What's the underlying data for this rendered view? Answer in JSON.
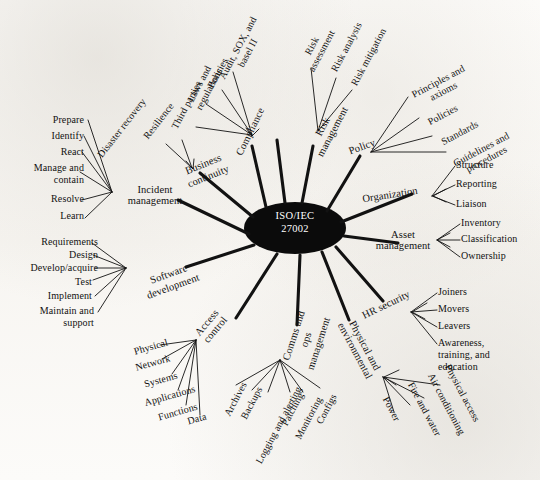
{
  "diagram": {
    "background_color": "#fbfaf8",
    "ink_color": "#111111",
    "center_fill": "#0b0b0b",
    "center_text_color": "#ffffff"
  },
  "center": {
    "label": "ISO/IEC\n27002",
    "line1": "ISO/IEC",
    "line2": "27002"
  },
  "branches": [
    {
      "id": "compliance",
      "label": "Compliance",
      "leaves": [
        "Audit, SOX, and\nbasel II",
        "Policies",
        "Laws and\nregulations",
        "Third parties"
      ]
    },
    {
      "id": "risk-management",
      "label": "Risk\nmanagement",
      "leaves": [
        "Risk\nassessment",
        "Risk analysis",
        "Risk mitigation"
      ]
    },
    {
      "id": "policy",
      "label": "Policy",
      "leaves": [
        "Principles and\naxioms",
        "Policies",
        "Standards",
        "Guidelines and\nprocedures"
      ]
    },
    {
      "id": "organization",
      "label": "Organization",
      "leaves": [
        "Structure",
        "Reporting",
        "Liaison"
      ]
    },
    {
      "id": "asset-management",
      "label": "Asset\nmanagement",
      "leaves": [
        "Inventory",
        "Classification",
        "Ownership"
      ]
    },
    {
      "id": "hr-security",
      "label": "HR security",
      "leaves": [
        "Joiners",
        "Movers",
        "Leavers",
        "Awareness,\ntraining, and\neducation"
      ]
    },
    {
      "id": "physical-and-environmental",
      "label": "Physical and\nenvironmental",
      "leaves": [
        "Physical access",
        "Air conditioning",
        "Fire and water",
        "Power"
      ]
    },
    {
      "id": "comms-and-ops-management",
      "label": "Comms and\nops\nmanagement",
      "leaves": [
        "Archives",
        "Backups",
        "Logging and alerting",
        "Patching",
        "Monitoring",
        "Configs"
      ]
    },
    {
      "id": "access-control",
      "label": "Access\ncontrol",
      "leaves": [
        "Physical",
        "Network",
        "Systems",
        "Applications",
        "Functions",
        "Data"
      ]
    },
    {
      "id": "software-development",
      "label": "Software\ndevelopment",
      "leaves": [
        "Requirements",
        "Design",
        "Develop/acquire",
        "Test",
        "Implement",
        "Maintain and\nsupport"
      ]
    },
    {
      "id": "incident-management",
      "label": "Incident\nmanagement",
      "leaves": [
        "Prepare",
        "Identify",
        "React",
        "Manage and\ncontain",
        "Resolve",
        "Learn"
      ]
    },
    {
      "id": "business-continuity",
      "label": "Business\ncontinuity",
      "leaves": [
        "Disaster recovery",
        "Resilience"
      ]
    }
  ],
  "labels": {
    "center_line1": "ISO/IEC",
    "center_line2": "27002",
    "compliance": "Compliance",
    "compliance_leaf_0": "Audit, SOX, and\nbasel II",
    "compliance_leaf_1": "Policies",
    "compliance_leaf_2": "Laws and\nregulations",
    "compliance_leaf_3": "Third parties",
    "risk_management": "Risk\nmanagement",
    "risk_leaf_0": "Risk\nassessment",
    "risk_leaf_1": "Risk analysis",
    "risk_leaf_2": "Risk mitigation",
    "policy": "Policy",
    "policy_leaf_0": "Principles and\naxioms",
    "policy_leaf_1": "Policies",
    "policy_leaf_2": "Standards",
    "policy_leaf_3": "Guidelines and\nprocedures",
    "organization": "Organization",
    "organization_leaf_0": "Structure",
    "organization_leaf_1": "Reporting",
    "organization_leaf_2": "Liaison",
    "asset_management": "Asset\nmanagement",
    "asset_leaf_0": "Inventory",
    "asset_leaf_1": "Classification",
    "asset_leaf_2": "Ownership",
    "hr_security": "HR security",
    "hr_leaf_0": "Joiners",
    "hr_leaf_1": "Movers",
    "hr_leaf_2": "Leavers",
    "hr_leaf_3": "Awareness,\ntraining, and\neducation",
    "physical_environmental": "Physical and\nenvironmental",
    "phys_leaf_0": "Physical access",
    "phys_leaf_1": "Air conditioning",
    "phys_leaf_2": "Fire and water",
    "phys_leaf_3": "Power",
    "comms_ops": "Comms and\nops\nmanagement",
    "comms_leaf_0": "Archives",
    "comms_leaf_1": "Backups",
    "comms_leaf_2": "Logging and alerting",
    "comms_leaf_3": "Patching",
    "comms_leaf_4": "Monitoring",
    "comms_leaf_5": "Configs",
    "access_control": "Access\ncontrol",
    "access_leaf_0": "Physical",
    "access_leaf_1": "Network",
    "access_leaf_2": "Systems",
    "access_leaf_3": "Applications",
    "access_leaf_4": "Functions",
    "access_leaf_5": "Data",
    "software_development": "Software\ndevelopment",
    "sw_leaf_0": "Requirements",
    "sw_leaf_1": "Design",
    "sw_leaf_2": "Develop/acquire",
    "sw_leaf_3": "Test",
    "sw_leaf_4": "Implement",
    "sw_leaf_5": "Maintain and\nsupport",
    "incident_management": "Incident\nmanagement",
    "inc_leaf_0": "Prepare",
    "inc_leaf_1": "Identify",
    "inc_leaf_2": "React",
    "inc_leaf_3": "Manage and\ncontain",
    "inc_leaf_4": "Resolve",
    "inc_leaf_5": "Learn",
    "business_continuity": "Business\ncontinuity",
    "bc_leaf_0": "Disaster recovery",
    "bc_leaf_1": "Resilience"
  }
}
